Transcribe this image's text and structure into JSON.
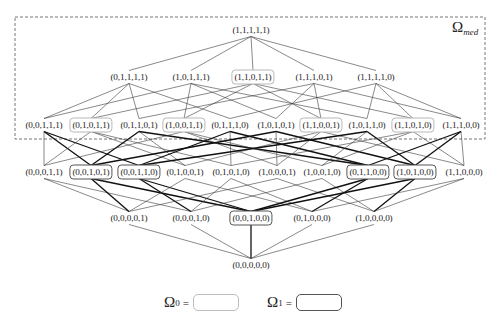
{
  "region": {
    "label_symbol": "Ω",
    "label_subscript": "med",
    "box": {
      "x": 15,
      "y": 17,
      "width": 470,
      "height": 122
    }
  },
  "levels": [
    {
      "y": 30,
      "nodes": [
        {
          "label": "(1,1,1,1,1)",
          "x": 251,
          "set": "none"
        }
      ]
    },
    {
      "y": 77,
      "nodes": [
        {
          "label": "(0,1,1,1,1)",
          "x": 129,
          "set": "none"
        },
        {
          "label": "(1,0,1,1,1)",
          "x": 191,
          "set": "none"
        },
        {
          "label": "(1,1,0,1,1)",
          "x": 253,
          "set": "omega0"
        },
        {
          "label": "(1,1,1,0,1)",
          "x": 314,
          "set": "none"
        },
        {
          "label": "(1,1,1,1,0)",
          "x": 376,
          "set": "none"
        }
      ]
    },
    {
      "y": 125,
      "nodes": [
        {
          "label": "(0,0,1,1,1)",
          "x": 44,
          "set": "none"
        },
        {
          "label": "(0,1,0,1,1)",
          "x": 91,
          "set": "omega0"
        },
        {
          "label": "(0,1,1,0,1)",
          "x": 139,
          "set": "none"
        },
        {
          "label": "(1,0,0,1,1)",
          "x": 184,
          "set": "omega0"
        },
        {
          "label": "(0,1,1,1,0)",
          "x": 230,
          "set": "none"
        },
        {
          "label": "(1,0,1,0,1)",
          "x": 276,
          "set": "none"
        },
        {
          "label": "(1,1,0,0,1)",
          "x": 321,
          "set": "omega0"
        },
        {
          "label": "(1,0,1,1,0)",
          "x": 367,
          "set": "none"
        },
        {
          "label": "(1,1,0,1,0)",
          "x": 413,
          "set": "omega0"
        },
        {
          "label": "(1,1,1,0,0)",
          "x": 461,
          "set": "none"
        }
      ]
    },
    {
      "y": 172,
      "nodes": [
        {
          "label": "(0,0,0,1,1)",
          "x": 44,
          "set": "none"
        },
        {
          "label": "(0,0,1,0,1)",
          "x": 91,
          "set": "omega1"
        },
        {
          "label": "(0,0,1,1,0)",
          "x": 139,
          "set": "omega1"
        },
        {
          "label": "(0,1,0,0,1)",
          "x": 185,
          "set": "none"
        },
        {
          "label": "(0,1,0,1,0)",
          "x": 231,
          "set": "none"
        },
        {
          "label": "(1,0,0,0,1)",
          "x": 277,
          "set": "none"
        },
        {
          "label": "(1,0,0,1,0)",
          "x": 322,
          "set": "none"
        },
        {
          "label": "(0,1,1,0,0)",
          "x": 368,
          "set": "omega1"
        },
        {
          "label": "(1,0,1,0,0)",
          "x": 415,
          "set": "omega1"
        },
        {
          "label": "(1,1,0,0,0)",
          "x": 464,
          "set": "none"
        }
      ]
    },
    {
      "y": 218,
      "nodes": [
        {
          "label": "(0,0,0,0,1)",
          "x": 129,
          "set": "none"
        },
        {
          "label": "(0,0,0,1,0)",
          "x": 191,
          "set": "none"
        },
        {
          "label": "(0,0,1,0,0)",
          "x": 251,
          "set": "omega1"
        },
        {
          "label": "(0,1,0,0,0)",
          "x": 312,
          "set": "none"
        },
        {
          "label": "(1,0,0,0,0)",
          "x": 374,
          "set": "none"
        }
      ]
    },
    {
      "y": 265,
      "nodes": [
        {
          "label": "(0,0,0,0,0)",
          "x": 251,
          "set": "none"
        }
      ]
    }
  ],
  "legend": [
    {
      "symbol": "Ω",
      "subscript": "0",
      "eq": "=",
      "set": "omega0",
      "x": 164,
      "y": 303
    },
    {
      "symbol": "Ω",
      "subscript": "1",
      "eq": "=",
      "set": "omega1",
      "x": 267,
      "y": 303
    }
  ],
  "colors": {
    "edge": "#3a3a3a",
    "edge_thick": "#111111",
    "omega0_border": "#b8b8b8",
    "omega1_border": "#555555",
    "region_border": "#666666"
  }
}
